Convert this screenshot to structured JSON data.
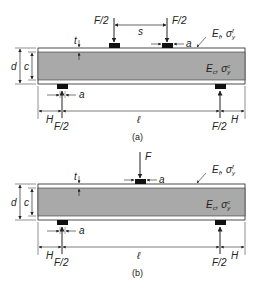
{
  "figures": [
    {
      "id": "a",
      "caption": "(a)",
      "description": "Four-point bending of sandwich beam",
      "loads": [
        {
          "label": "F/2",
          "x": 113
        },
        {
          "label": "F/2",
          "x": 167
        }
      ],
      "load_spacing_label": "s",
      "pad_width_label": "a",
      "support_labels": [
        "F/2",
        "F/2"
      ],
      "span_label": "ℓ",
      "overhang_label": "H",
      "thickness_labels": {
        "face": "t",
        "core": "c",
        "total": "d"
      },
      "face_material": {
        "E": "E",
        "E_sub": "f",
        "sigma": "σ",
        "sigma_sub": "y",
        "sigma_sup": "f"
      },
      "core_material": {
        "E": "E",
        "E_sub": "c",
        "sigma": "σ",
        "sigma_sub": "y",
        "sigma_sup": "c"
      }
    },
    {
      "id": "b",
      "caption": "(b)",
      "description": "Three-point bending of sandwich beam",
      "loads": [
        {
          "label": "F",
          "x": 140
        }
      ],
      "pad_width_label": "a",
      "support_labels": [
        "F/2",
        "F/2"
      ],
      "span_label": "ℓ",
      "overhang_label": "H",
      "thickness_labels": {
        "face": "t",
        "core": "c",
        "total": "d"
      },
      "face_material": {
        "E": "E",
        "E_sub": "f",
        "sigma": "σ",
        "sigma_sub": "y",
        "sigma_sup": "f"
      },
      "core_material": {
        "E": "E",
        "E_sub": "c",
        "sigma": "σ",
        "sigma_sub": "y",
        "sigma_sup": "c"
      }
    }
  ],
  "colors": {
    "core": "#a9a9a9",
    "face": "#ffffff",
    "pad": "#111111",
    "line": "#222222"
  }
}
